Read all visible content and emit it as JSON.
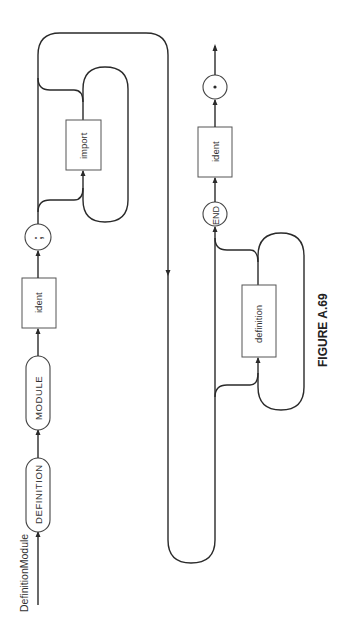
{
  "diagram": {
    "title": "DefinitionModule",
    "caption": "FIGURE A.69",
    "orientation": "rotated 90 degrees counter-clockwise",
    "nodes": {
      "definition_keyword": "DEFINITION",
      "module_keyword": "MODULE",
      "ident1": "ident",
      "semicolon": ";",
      "import": "import",
      "definition": "definition",
      "end_keyword": "END",
      "ident2": "ident",
      "period": "."
    },
    "sequence": [
      "DEFINITION",
      "MODULE",
      "ident",
      ";",
      "{import}",
      "{definition}",
      "END",
      "ident",
      "."
    ]
  }
}
